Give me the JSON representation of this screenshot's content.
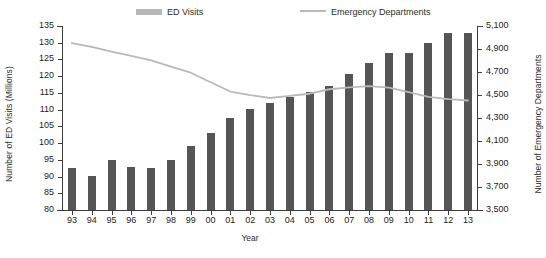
{
  "legend": {
    "bar_label": "ED Visits",
    "line_label": "Emergency Departments",
    "bar_color": "#b7b7b7",
    "line_color": "#b9b9b9"
  },
  "axes": {
    "left_title": "Number of ED Visits (Millions)",
    "right_title": "Number of Emergency Departments",
    "x_title": "Year",
    "left_ticks": [
      "135",
      "130",
      "125",
      "120",
      "115",
      "110",
      "105",
      "100",
      "95",
      "90",
      "85",
      "80"
    ],
    "right_ticks": [
      "5,100",
      "4,900",
      "4,700",
      "4,500",
      "4,300",
      "4,100",
      "3,900",
      "3,700",
      "3,500"
    ]
  },
  "colors": {
    "bar": "#555555",
    "line": "#b9b9b9",
    "axis": "#3d3d3d",
    "background": "#ffffff"
  },
  "chart_data": {
    "type": "bar",
    "title": "",
    "xlabel": "Year",
    "ylabel": "Number of ED Visits (Millions)",
    "y2label": "Number of Emergency Departments",
    "ylim": [
      80,
      135
    ],
    "y2lim": [
      3500,
      5100
    ],
    "grid": false,
    "legend_position": "top-center",
    "categories": [
      "93",
      "94",
      "95",
      "96",
      "97",
      "98",
      "99",
      "00",
      "01",
      "02",
      "03",
      "04",
      "05",
      "06",
      "07",
      "08",
      "09",
      "10",
      "11",
      "12",
      "13"
    ],
    "series": [
      {
        "name": "ED Visits",
        "type": "bar",
        "axis": "left",
        "unit": "millions",
        "values": [
          92.5,
          90.3,
          94.8,
          93.0,
          92.7,
          94.8,
          99.2,
          103.0,
          107.5,
          110.2,
          111.9,
          113.9,
          115.3,
          117.0,
          120.8,
          123.8,
          126.9,
          127.0,
          129.8,
          132.8,
          133.0
        ]
      },
      {
        "name": "Emergency Departments",
        "type": "line",
        "axis": "right",
        "unit": "count",
        "values": [
          4952,
          4919,
          4877,
          4841,
          4802,
          4747,
          4694,
          4611,
          4530,
          4499,
          4474,
          4492,
          4511,
          4550,
          4566,
          4577,
          4564,
          4524,
          4484,
          4464,
          4452
        ]
      }
    ]
  }
}
